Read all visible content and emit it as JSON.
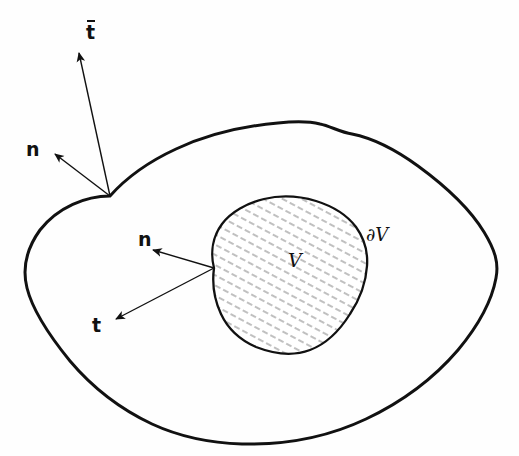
{
  "figure": {
    "kind": "hand-drawn continuum mechanics sketch",
    "canvas": {
      "width": 519,
      "height": 456
    },
    "background_color": "#fefefe",
    "ink_color": "#111111",
    "hatch_color": "#9a9a9a"
  },
  "labels": {
    "traction_outer": "t",
    "traction_outer_overbar": true,
    "normal_outer": "n",
    "normal_inner": "n",
    "traction_inner": "t",
    "volume": "V",
    "boundary": "∂V"
  },
  "label_positions": {
    "traction_outer": {
      "x": 86,
      "y": 20
    },
    "normal_outer": {
      "x": 26,
      "y": 140
    },
    "normal_inner": {
      "x": 138,
      "y": 230
    },
    "traction_inner": {
      "x": 92,
      "y": 316
    },
    "volume": {
      "x": 288,
      "y": 251
    },
    "boundary": {
      "x": 366,
      "y": 226
    }
  },
  "arrows": [
    {
      "name": "traction-outer-arrow",
      "label": "t",
      "from": {
        "x": 110,
        "y": 196
      },
      "to": {
        "x": 77,
        "y": 50
      }
    },
    {
      "name": "normal-outer-arrow",
      "label": "n",
      "from": {
        "x": 110,
        "y": 196
      },
      "to": {
        "x": 52,
        "y": 152
      }
    },
    {
      "name": "normal-inner-arrow",
      "label": "n",
      "from": {
        "x": 214,
        "y": 268
      },
      "to": {
        "x": 150,
        "y": 249
      }
    },
    {
      "name": "traction-inner-arrow",
      "label": "t",
      "from": {
        "x": 214,
        "y": 268
      },
      "to": {
        "x": 113,
        "y": 321
      }
    }
  ],
  "shapes": {
    "outer_body": {
      "name": "outer-body-boundary",
      "filled": false,
      "stroke_width": 3.0,
      "path": "M 110 196 C 130 176 168 152 205 140 C 250 126 290 122 320 124 C 342 126 358 130 378 140 C 410 155 448 182 470 210 C 490 236 498 256 496 276 C 493 302 478 330 455 356 C 428 386 392 410 350 426 C 306 442 258 446 214 442 C 176 438 140 426 112 408 C 84 390 62 366 46 340 C 32 316 24 300 25 284 C 26 268 32 252 44 236 C 62 214 88 200 110 196 Z"
    },
    "inner_volume": {
      "name": "inner-volume-boundary",
      "filled": true,
      "fill": "#ffffff",
      "stroke_width": 2.2,
      "path": "M 214 268 C 212 252 215 236 224 224 C 234 210 252 202 272 199 C 292 196 312 198 330 206 C 346 213 358 224 364 238 C 370 252 369 266 364 280 C 360 294 352 308 342 320 C 330 334 314 346 296 351 C 278 356 258 352 242 342 C 228 333 219 318 214 300 C 211 289 214 278 214 268 Z"
    }
  },
  "hatching": {
    "name": "inner-volume-hatch",
    "style": "short dashes",
    "angle_deg": 62,
    "spacing_px": 9,
    "color": "#9a9a9a"
  }
}
